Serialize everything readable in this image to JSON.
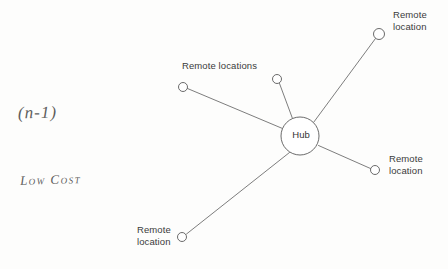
{
  "diagram": {
    "type": "hub-and-spoke network topology",
    "background_color": "#fdfdfc",
    "line_color": "#6e6e6e",
    "text_color": "#3b3b3b",
    "hub": {
      "label": "Hub",
      "cx": 300,
      "cy": 136,
      "r": 19
    },
    "nodes": [
      {
        "id": "n1",
        "label": "Remote locations",
        "cx": 183,
        "cy": 87,
        "r": 4.5
      },
      {
        "id": "n2",
        "label": "",
        "cx": 277,
        "cy": 79,
        "r": 4.5
      },
      {
        "id": "n3",
        "label": "Remote\nlocation",
        "cx": 379,
        "cy": 34,
        "r": 5.5
      },
      {
        "id": "n4",
        "label": "Remote\nlocation",
        "cx": 375,
        "cy": 170,
        "r": 4.5
      },
      {
        "id": "n5",
        "label": "Remote\nlocation",
        "cx": 182,
        "cy": 237,
        "r": 4.5
      }
    ],
    "labels": {
      "remote_locations_shared": "Remote locations",
      "top_right": "Remote\nlocation",
      "right": "Remote\nlocation",
      "bottom_left": "Remote\nlocation"
    }
  },
  "annotations": {
    "formula": "(n-1)",
    "cost": "Low Cost"
  }
}
